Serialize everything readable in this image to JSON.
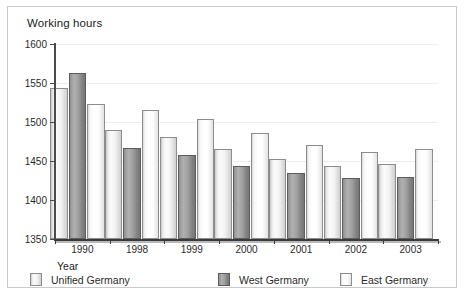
{
  "chart_data": {
    "type": "bar",
    "title": "Working hours",
    "xlabel": "Year",
    "ylabel": "",
    "categories": [
      "1990",
      "1998",
      "1999",
      "2000",
      "2001",
      "2002",
      "2003"
    ],
    "series": [
      {
        "name": "Unified Germany",
        "values": [
          1543,
          1490,
          1481,
          1465,
          1452,
          1444,
          1446
        ],
        "color": "#f2f2f2"
      },
      {
        "name": "West Germany",
        "values": [
          1563,
          1467,
          1458,
          1444,
          1434,
          1428,
          1430
        ],
        "color": "#9b9b9b"
      },
      {
        "name": "East Germany",
        "values": [
          1523,
          1515,
          1504,
          1486,
          1470,
          1461,
          1465
        ],
        "color": "#fdfdfd"
      }
    ],
    "ylim": [
      1350,
      1600
    ],
    "yticks": [
      1350,
      1400,
      1450,
      1500,
      1550,
      1600
    ],
    "ytick_labels": [
      "1350",
      "1400",
      "1450",
      "1500",
      "1550",
      "1600"
    ],
    "grid": true,
    "legend_position": "bottom"
  },
  "legend": {
    "items": [
      {
        "label": "Unified Germany"
      },
      {
        "label": "West Germany"
      },
      {
        "label": "East Germany"
      }
    ]
  }
}
